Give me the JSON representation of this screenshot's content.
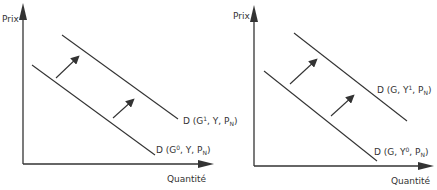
{
  "panels": [
    {
      "y_label": "Prix",
      "x_label": "Quantité",
      "upper_curve": {
        "base": "D (G",
        "sup": "1",
        "mid": ", Y, P",
        "sub": "N",
        "end": ")"
      },
      "lower_curve": {
        "base": "D (G",
        "sup": "0",
        "mid": ", Y, P",
        "sub": "N",
        "end": ")"
      }
    },
    {
      "y_label": "Prix",
      "x_label": "Quantité",
      "upper_curve": {
        "base": "D (G, Y",
        "sup": "1",
        "mid": ", P",
        "sub": "N",
        "end": ")"
      },
      "lower_curve": {
        "base": "D (G, Y",
        "sup": "0",
        "mid": ", P",
        "sub": "N",
        "end": ")"
      }
    }
  ],
  "colors": {
    "line": "#333333",
    "text": "#333333"
  }
}
